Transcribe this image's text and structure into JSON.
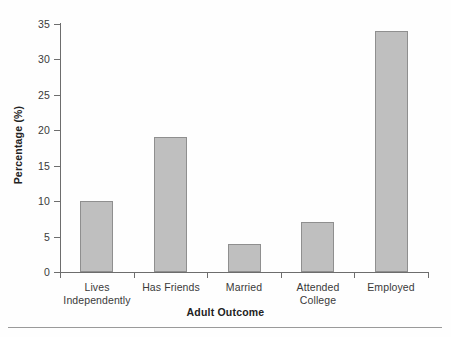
{
  "chart_data": {
    "type": "bar",
    "title": "",
    "subtitle": "",
    "xlabel": "Adult Outcome",
    "ylabel": "Percentage (%)",
    "categories": [
      "Lives Independently",
      "Has Friends",
      "Married",
      "Attended College",
      "Employed"
    ],
    "category_lines": [
      [
        "Lives",
        "Independently"
      ],
      [
        "Has Friends"
      ],
      [
        "Married"
      ],
      [
        "Attended",
        "College"
      ],
      [
        "Employed"
      ]
    ],
    "values": [
      10,
      19,
      4,
      7,
      34
    ],
    "ylim": [
      0,
      35
    ],
    "ytick_labels": [
      "0",
      "5",
      "10",
      "15",
      "20",
      "25",
      "30",
      "35"
    ],
    "ytick_values": [
      0,
      5,
      10,
      15,
      20,
      25,
      30,
      35
    ],
    "grid": false,
    "legend": "none",
    "bar_fill_color": "#bfbfbf",
    "bar_edge_color": "#8f8f8f",
    "axis_color": "#6d6d6d",
    "background_color": "#fefefe"
  },
  "axes": {
    "x_title": "Adult Outcome",
    "y_title": "Percentage (%)"
  },
  "ticks": {
    "y": [
      {
        "label": "35",
        "value": 35
      },
      {
        "label": "30",
        "value": 30
      },
      {
        "label": "25",
        "value": 25
      },
      {
        "label": "20",
        "value": 20
      },
      {
        "label": "15",
        "value": 15
      },
      {
        "label": "10",
        "value": 10
      },
      {
        "label": "5",
        "value": 5
      },
      {
        "label": "0",
        "value": 0
      }
    ]
  },
  "bars": [
    {
      "name": "lives-independently",
      "line1": "Lives",
      "line2": "Independently",
      "value": 10
    },
    {
      "name": "has-friends",
      "line1": "Has Friends",
      "line2": "",
      "value": 19
    },
    {
      "name": "married",
      "line1": "Married",
      "line2": "",
      "value": 4
    },
    {
      "name": "attended-college",
      "line1": "Attended",
      "line2": "College",
      "value": 7
    },
    {
      "name": "employed",
      "line1": "Employed",
      "line2": "",
      "value": 34
    }
  ]
}
